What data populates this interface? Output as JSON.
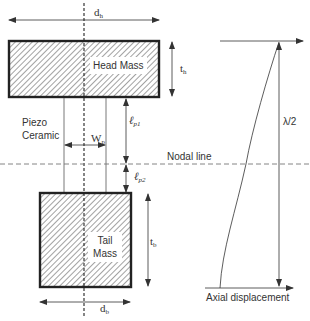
{
  "diagram": {
    "type": "transducer-schematic",
    "head_mass": {
      "label": "Head Mass",
      "width_symbol": "d",
      "width_sub": "h",
      "thickness_symbol": "t",
      "thickness_sub": "h"
    },
    "piezo": {
      "label_line1": "Piezo",
      "label_line2": "Ceramic",
      "width_symbol": "W",
      "width_sub": "p",
      "length1_symbol": "ℓ",
      "length1_sub": "p1",
      "length2_symbol": "ℓ",
      "length2_sub": "p2"
    },
    "nodal_line": {
      "label": "Nodal line"
    },
    "tail_mass": {
      "label_line1": "Tail",
      "label_line2": "Mass",
      "width_symbol": "d",
      "width_sub": "b",
      "thickness_symbol": "t",
      "thickness_sub": "b"
    },
    "displacement_plot": {
      "length_label": "λ/2",
      "axis_label": "Axial displacement"
    },
    "colors": {
      "line": "#333333",
      "hatch": "#8a8a8a",
      "dashed": "#666666",
      "background": "#ffffff"
    }
  }
}
